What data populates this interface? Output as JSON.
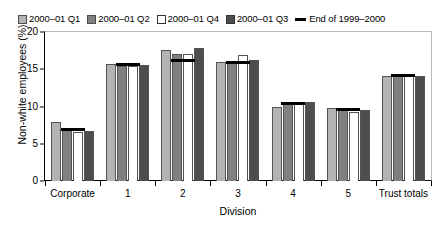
{
  "chart_data": {
    "type": "bar",
    "title": "",
    "subtitle": "",
    "xlabel": "Division",
    "ylabel": "Non-white employees (%)",
    "ylim": [
      0,
      20
    ],
    "yticks": [
      0,
      5,
      10,
      15,
      20
    ],
    "grid": false,
    "legend_position": "top-left",
    "categories": [
      "Corporate",
      "1",
      "2",
      "3",
      "4",
      "5",
      "Trust totals"
    ],
    "series": [
      {
        "name": "2000–01 Q1",
        "color": "#b3b3b3",
        "values": [
          7.9,
          15.7,
          17.6,
          16.0,
          9.9,
          9.8,
          14.1
        ]
      },
      {
        "name": "2000–01 Q2",
        "color": "#808080",
        "values": [
          6.8,
          15.5,
          17.0,
          15.8,
          10.6,
          9.5,
          14.1
        ]
      },
      {
        "name": "2000–01 Q4",
        "color": "#ffffff",
        "values": [
          6.6,
          15.5,
          17.1,
          16.9,
          10.6,
          9.3,
          14.3
        ]
      },
      {
        "name": "2000–01 Q3",
        "color": "#4d4d4d",
        "values": [
          6.7,
          15.6,
          17.8,
          16.3,
          10.6,
          9.5,
          14.1
        ]
      }
    ],
    "reference_line": {
      "name": "End of 1999–2000",
      "color": "#000000",
      "values": [
        6.9,
        15.6,
        16.2,
        15.9,
        10.4,
        9.6,
        14.2
      ]
    }
  },
  "legend": {
    "items": [
      {
        "label": "2000–01 Q1",
        "marker": "swatch-light-gray-icon"
      },
      {
        "label": "2000–01 Q2",
        "marker": "swatch-medium-gray-icon"
      },
      {
        "label": "2000–01 Q4",
        "marker": "swatch-white-icon"
      },
      {
        "label": "2000–01 Q3",
        "marker": "swatch-dark-gray-icon"
      },
      {
        "label": "End of 1999–2000",
        "marker": "line-black-icon"
      }
    ]
  },
  "axes": {
    "y_title": "Non-white employees (%)",
    "y_ticks": [
      "20",
      "15",
      "10",
      "5",
      "0"
    ],
    "x_title": "Division",
    "x_ticks": [
      "Corporate",
      "1",
      "2",
      "3",
      "4",
      "5",
      "Trust totals"
    ]
  }
}
